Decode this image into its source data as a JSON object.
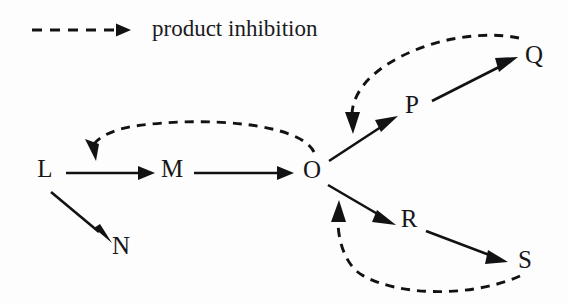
{
  "figure": {
    "type": "pathway-diagram",
    "background_color": "#fdfdfd",
    "ink_color": "#121214"
  },
  "legend": {
    "label": "product inhibition",
    "line_style": "dashed",
    "arrow_icon": "dashed-arrow-icon"
  },
  "nodes": [
    {
      "id": "L",
      "label": "L",
      "x": 45,
      "y": 171
    },
    {
      "id": "M",
      "label": "M",
      "x": 172,
      "y": 171
    },
    {
      "id": "N",
      "label": "N",
      "x": 121,
      "y": 248
    },
    {
      "id": "O",
      "label": "O",
      "x": 312,
      "y": 172
    },
    {
      "id": "P",
      "label": "P",
      "x": 412,
      "y": 107
    },
    {
      "id": "Q",
      "label": "Q",
      "x": 534,
      "y": 57
    },
    {
      "id": "R",
      "label": "R",
      "x": 409,
      "y": 221
    },
    {
      "id": "S",
      "label": "S",
      "x": 525,
      "y": 262
    }
  ],
  "edges": [
    {
      "id": "L-M",
      "from": "L",
      "to": "M",
      "style": "solid",
      "kind": "reaction"
    },
    {
      "id": "L-N",
      "from": "L",
      "to": "N",
      "style": "solid",
      "kind": "reaction"
    },
    {
      "id": "M-O",
      "from": "M",
      "to": "O",
      "style": "solid",
      "kind": "reaction"
    },
    {
      "id": "O-P",
      "from": "O",
      "to": "P",
      "style": "solid",
      "kind": "reaction"
    },
    {
      "id": "P-Q",
      "from": "P",
      "to": "Q",
      "style": "solid",
      "kind": "reaction"
    },
    {
      "id": "O-R",
      "from": "O",
      "to": "R",
      "style": "solid",
      "kind": "reaction"
    },
    {
      "id": "R-S",
      "from": "R",
      "to": "S",
      "style": "solid",
      "kind": "reaction"
    },
    {
      "id": "O-LM",
      "from": "O",
      "to": "L-M",
      "style": "dashed",
      "kind": "product inhibition"
    },
    {
      "id": "Q-OP",
      "from": "Q",
      "to": "O-P",
      "style": "dashed",
      "kind": "product inhibition"
    },
    {
      "id": "S-OR",
      "from": "S",
      "to": "O-R",
      "style": "dashed",
      "kind": "product inhibition"
    }
  ]
}
